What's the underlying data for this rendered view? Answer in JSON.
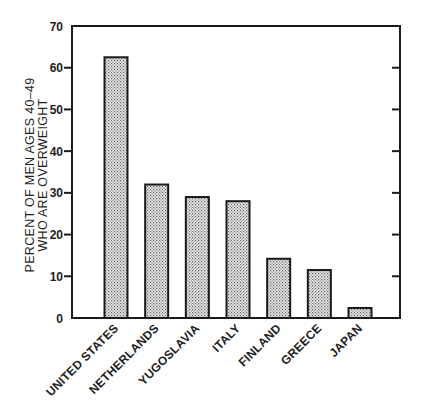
{
  "chart_data": {
    "type": "bar",
    "title": "",
    "xlabel": "",
    "ylabel": "PERCENT OF MEN AGES 40–49 WHO ARE OVERWEIGHT",
    "ylabel_lines": [
      "PERCENT OF MEN AGES 40–49",
      "WHO ARE OVERWEIGHT"
    ],
    "categories": [
      "UNITED STATES",
      "NETHERLANDS",
      "YUGOSLAVIA",
      "ITALY",
      "FINLAND",
      "GREECE",
      "JAPAN"
    ],
    "values": [
      62.5,
      32,
      29,
      28,
      14.2,
      11.5,
      2.4
    ],
    "ylim": [
      0,
      70
    ],
    "yticks": [
      0,
      10,
      20,
      30,
      40,
      50,
      60,
      70
    ],
    "grid": false,
    "legend": null,
    "bar_fill": "stippled gray",
    "colors": {
      "bar_fill": "#c8c8c8",
      "bar_stroke": "#1a1a1a",
      "axis": "#1a1a1a"
    }
  }
}
